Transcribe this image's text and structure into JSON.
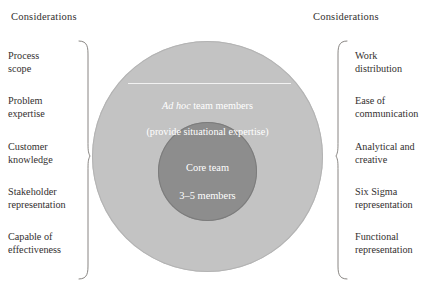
{
  "diagram": {
    "title_left": "Considerations",
    "title_right": "Considerations",
    "colors": {
      "outer_ring": "#c3c3c3",
      "core_circle": "#8d8d8d",
      "divider_line": "#f2f2f2",
      "text_on_circle": "#ffffff",
      "label_text": "#33302f",
      "brace_stroke": "#7a7774"
    },
    "circles": {
      "outer": {
        "italic_prefix": "Ad hoc",
        "rest_of_line": " team members",
        "second_line": "(provide situational expertise)",
        "full_text": "Ad hoc team members\n(provide situational expertise)"
      },
      "core": {
        "line1": "Core team",
        "line2": "3–5 members",
        "full_text": "Core team\n3–5 members"
      }
    },
    "left_considerations": [
      {
        "text": "Process\nscope",
        "top": 50
      },
      {
        "text": "Problem\nexpertise",
        "top": 95
      },
      {
        "text": "Customer\nknowledge",
        "top": 141
      },
      {
        "text": "Stakeholder\nrepresentation",
        "top": 186
      },
      {
        "text": "Capable of\neffectiveness",
        "top": 231
      }
    ],
    "right_considerations": [
      {
        "text": "Work\ndistribution",
        "top": 50
      },
      {
        "text": "Ease of\ncommunication",
        "top": 95
      },
      {
        "text": "Analytical and\ncreative",
        "top": 141
      },
      {
        "text": "Six Sigma\nrepresentation",
        "top": 186
      },
      {
        "text": "Functional\nrepresentation",
        "top": 231
      }
    ]
  }
}
